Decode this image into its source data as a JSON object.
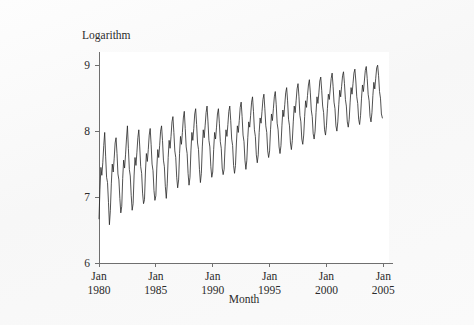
{
  "chart_data": {
    "type": "line",
    "title": "",
    "ylabel": "Logarithm",
    "xlabel": "Month",
    "ylim": [
      6,
      9.2
    ],
    "yticks": [
      6,
      7,
      8,
      9
    ],
    "ytick_labels": [
      "6",
      "7",
      "8",
      "9"
    ],
    "xlim": [
      "1980-01",
      "2005-06"
    ],
    "xticks": [
      "1980-01",
      "1985-01",
      "1990-01",
      "1995-01",
      "2000-01",
      "2005-01"
    ],
    "xtick_labels": [
      {
        "line1": "Jan",
        "line2": "1980"
      },
      {
        "line1": "Jan",
        "line2": "1985"
      },
      {
        "line1": "Jan",
        "line2": "1990"
      },
      {
        "line1": "Jan",
        "line2": "1995"
      },
      {
        "line1": "Jan",
        "line2": "2000"
      },
      {
        "line1": "Jan",
        "line2": "2005"
      }
    ],
    "grid": false,
    "legend": null,
    "line_color": "#262626",
    "series": [
      {
        "name": "Logarithm",
        "x_start": "1980-01",
        "frequency": "monthly",
        "values": [
          6.67,
          7.12,
          7.45,
          7.33,
          7.52,
          7.78,
          7.98,
          7.62,
          7.3,
          7.22,
          6.92,
          6.58,
          6.8,
          7.2,
          7.5,
          7.38,
          7.58,
          7.82,
          7.9,
          7.66,
          7.35,
          7.26,
          6.98,
          6.76,
          6.86,
          7.28,
          7.56,
          7.44,
          7.64,
          7.88,
          8.08,
          7.74,
          7.42,
          7.32,
          7.02,
          6.8,
          6.9,
          7.32,
          7.6,
          7.48,
          7.68,
          7.9,
          8.02,
          7.76,
          7.46,
          7.36,
          7.06,
          6.9,
          6.96,
          7.38,
          7.66,
          7.54,
          7.72,
          7.94,
          8.04,
          7.8,
          7.5,
          7.4,
          7.1,
          6.95,
          7.02,
          7.44,
          7.72,
          7.6,
          7.78,
          8.0,
          8.08,
          7.86,
          7.56,
          7.46,
          7.16,
          6.98,
          7.2,
          7.6,
          7.86,
          7.74,
          7.92,
          8.14,
          8.22,
          7.98,
          7.7,
          7.6,
          7.3,
          7.14,
          7.26,
          7.66,
          7.92,
          7.8,
          7.98,
          8.2,
          8.3,
          8.04,
          7.76,
          7.66,
          7.36,
          7.18,
          7.3,
          7.7,
          7.98,
          7.86,
          8.04,
          8.26,
          8.34,
          8.1,
          7.82,
          7.72,
          7.42,
          7.22,
          7.36,
          7.76,
          8.02,
          7.9,
          8.08,
          8.28,
          8.38,
          8.14,
          7.86,
          7.76,
          7.46,
          7.3,
          7.38,
          7.72,
          7.98,
          7.88,
          8.06,
          8.26,
          8.34,
          8.12,
          7.84,
          7.74,
          7.44,
          7.34,
          7.42,
          7.76,
          8.02,
          7.92,
          8.1,
          8.3,
          8.38,
          8.16,
          7.88,
          7.78,
          7.48,
          7.36,
          7.48,
          7.82,
          8.08,
          7.98,
          8.16,
          8.36,
          8.44,
          8.22,
          7.94,
          7.84,
          7.56,
          7.42,
          7.56,
          7.9,
          8.14,
          8.06,
          8.24,
          8.44,
          8.52,
          8.3,
          8.02,
          7.92,
          7.64,
          7.52,
          7.64,
          7.98,
          8.2,
          8.12,
          8.3,
          8.48,
          8.56,
          8.34,
          8.08,
          7.98,
          7.7,
          7.6,
          7.7,
          8.02,
          8.26,
          8.16,
          8.34,
          8.52,
          8.6,
          8.4,
          8.12,
          8.02,
          7.76,
          7.66,
          7.78,
          8.08,
          8.32,
          8.22,
          8.4,
          8.58,
          8.66,
          8.46,
          8.18,
          8.08,
          7.82,
          7.72,
          7.86,
          8.14,
          8.38,
          8.28,
          8.46,
          8.64,
          8.72,
          8.52,
          8.24,
          8.14,
          7.88,
          7.8,
          7.94,
          8.22,
          8.46,
          8.36,
          8.54,
          8.7,
          8.78,
          8.58,
          8.32,
          8.22,
          7.96,
          7.88,
          8.0,
          8.28,
          8.52,
          8.42,
          8.58,
          8.76,
          8.82,
          8.62,
          8.38,
          8.28,
          8.02,
          7.94,
          8.08,
          8.34,
          8.56,
          8.48,
          8.64,
          8.8,
          8.88,
          8.68,
          8.44,
          8.34,
          8.08,
          8.0,
          8.14,
          8.4,
          8.62,
          8.52,
          8.68,
          8.84,
          8.9,
          8.72,
          8.48,
          8.38,
          8.14,
          8.06,
          8.18,
          8.44,
          8.66,
          8.56,
          8.72,
          8.88,
          8.94,
          8.76,
          8.52,
          8.42,
          8.18,
          8.1,
          8.24,
          8.5,
          8.7,
          8.6,
          8.76,
          8.92,
          8.98,
          8.8,
          8.56,
          8.46,
          8.22,
          8.14,
          8.28,
          8.54,
          8.74,
          8.64,
          8.8,
          8.96,
          9.0,
          8.84,
          8.6,
          8.5,
          8.26,
          8.2
        ]
      }
    ]
  }
}
